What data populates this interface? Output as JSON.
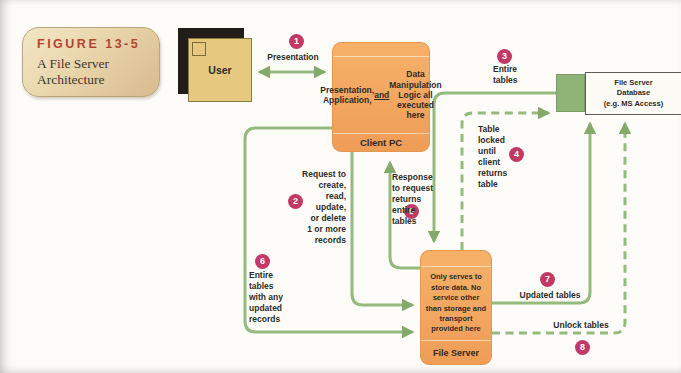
{
  "figure": {
    "label": "FIGURE 13-5",
    "title": "A File Server\nArchitecture"
  },
  "nodes": {
    "user": {
      "label": "User"
    },
    "client_pc": {
      "body_pre": "Presentation,\nApplication,\n",
      "body_and": "and",
      "body_post": " Data\nManipulation\nLogic all\nexecuted here",
      "label": "Client PC"
    },
    "file_server": {
      "body": "Only serves to\nstore data. No\nservice other\nthan storage and\ntransport\nprovided here",
      "label": "File Server"
    },
    "database": {
      "label": "File Server\nDatabase\n(e.g. MS Access)"
    }
  },
  "annotations": [
    {
      "num": "1",
      "text": "Presentation"
    },
    {
      "num": "2",
      "text": "Request to\ncreate,\nread,\nupdate,\nor delete\n1 or more\nrecords"
    },
    {
      "num": "3",
      "text": "Entire\ntables"
    },
    {
      "num": "4",
      "text": "Table\nlocked\nuntil\nclient\nreturns\ntable"
    },
    {
      "num": "5",
      "text": "Response\nto request\nreturns\nentire\ntables"
    },
    {
      "num": "6",
      "text": "Entire\ntables\nwith any\nupdated\nrecords"
    },
    {
      "num": "7",
      "text": "Updated tables"
    },
    {
      "num": "8",
      "text": "Unlock tables"
    }
  ],
  "colors": {
    "line_green": "#94ba7d",
    "arrowhead_green": "#83a96b",
    "box_orange": "#f2a55f",
    "badge_tan": "#e9d5ab",
    "step_circle": "#c23a64",
    "figure_label_red": "#b44431",
    "cube_face": "#e6c87e",
    "db_face_green": "#90b478"
  }
}
